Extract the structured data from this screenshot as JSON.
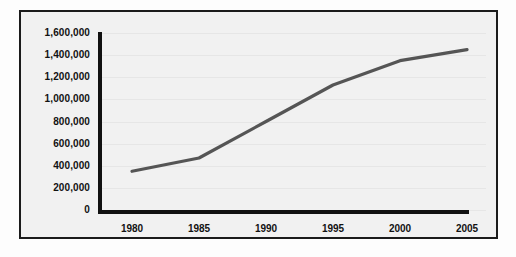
{
  "chart_data": {
    "type": "line",
    "title": "",
    "subtitle": "",
    "xlabel": "",
    "ylabel": "",
    "x": [
      1980,
      1985,
      1990,
      1995,
      2000,
      2005
    ],
    "categories": [
      "1980",
      "1985",
      "1990",
      "1995",
      "2000",
      "2005"
    ],
    "values": [
      350000,
      470000,
      800000,
      1130000,
      1350000,
      1450000
    ],
    "series": [
      {
        "name": "",
        "values": [
          350000,
          470000,
          800000,
          1130000,
          1350000,
          1450000
        ]
      }
    ],
    "xlim": [
      1980,
      2005
    ],
    "ylim": [
      0,
      1600000
    ],
    "ytick_labels": [
      "1,600,000",
      "1,400,000",
      "1,200,000",
      "1,000,000",
      "800,000",
      "600,000",
      "400,000",
      "200,000",
      "0"
    ],
    "ytick_values": [
      1600000,
      1400000,
      1200000,
      1000000,
      800000,
      600000,
      400000,
      200000,
      0
    ],
    "xtick_labels": [
      "1980",
      "1985",
      "1990",
      "1995",
      "2000",
      "2005"
    ],
    "grid": true,
    "legend": false,
    "legend_position": "none",
    "line_color": "#555555",
    "axis_color": "#111111",
    "background_color": "#f1f1f1",
    "frame_color": "#1b1b1b",
    "annotations": []
  }
}
